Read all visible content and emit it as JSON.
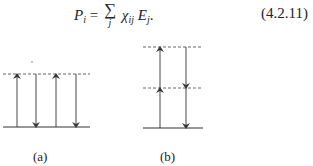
{
  "equation": {
    "lhs": "P",
    "lhs_sub": "i",
    "equals": "=",
    "sum_symbol": "∑",
    "sum_index": "j",
    "term1": "χ",
    "term1_sub": "ij",
    "term2": "E",
    "term2_sub": "j",
    "trailing": ".",
    "number": "(4.2.11)"
  },
  "diagrams": [
    {
      "label": "(a)"
    },
    {
      "label": "(b)"
    }
  ],
  "colors": {
    "line": "#333333",
    "dash": "#666666"
  }
}
